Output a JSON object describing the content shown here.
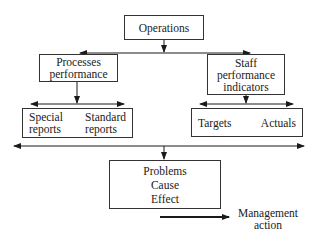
{
  "diagram": {
    "operations": {
      "label": "Operations"
    },
    "processes": {
      "line1": "Processes",
      "line2": "performance"
    },
    "staff": {
      "line1": "Staff",
      "line2": "performance",
      "line3": "indicators"
    },
    "reports": {
      "left": {
        "line1": "Special",
        "line2": "reports"
      },
      "right": {
        "line1": "Standard",
        "line2": "reports"
      }
    },
    "measures": {
      "left": "Targets",
      "right": "Actuals"
    },
    "problems": {
      "line1": "Problems",
      "line2": "Cause",
      "line3": "Effect"
    },
    "management_action": {
      "line1": "Management",
      "line2": "action"
    },
    "colors": {
      "line": "#1a1a1a",
      "border": "#333333",
      "background": "#ffffff"
    }
  }
}
